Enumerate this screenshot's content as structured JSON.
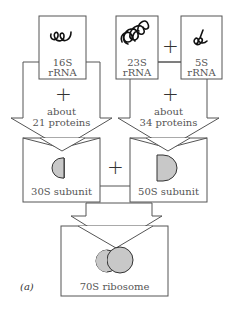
{
  "diagram": {
    "figure_label": "(a)",
    "nodes": {
      "rrna_16s": {
        "line1": "16S",
        "line2": "rRNA",
        "icon": "coiled-rna-icon"
      },
      "rrna_23s": {
        "line1": "23S",
        "line2": "rRNA",
        "icon": "coiled-rna-icon"
      },
      "rrna_5s": {
        "line1": "5S",
        "line2": "rRNA",
        "icon": "coiled-rna-icon"
      },
      "subunit_30s": {
        "label": "30S subunit"
      },
      "subunit_50s": {
        "label": "50S subunit"
      },
      "ribosome_70s": {
        "label": "70S ribosome"
      }
    },
    "arrows": {
      "left": {
        "plus": "+",
        "line1": "about",
        "line2": "21 proteins"
      },
      "right": {
        "plus": "+",
        "line1": "about",
        "line2": "34 proteins"
      }
    },
    "operators": {
      "rrna_plus": "+",
      "subunit_plus": "+"
    },
    "colors": {
      "line": "#555555",
      "fill_shape": "#c8c8c8",
      "background": "#ffffff"
    }
  }
}
